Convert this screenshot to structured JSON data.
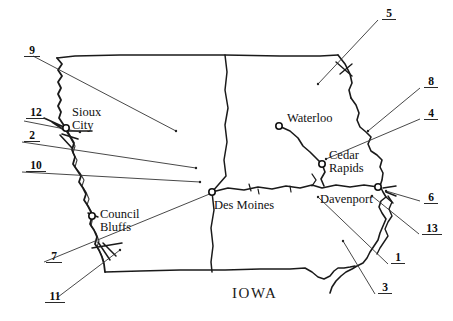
{
  "figure": {
    "type": "hand-drawn-map",
    "region_label": "IOWA",
    "background_color": "#ffffff",
    "ink_color": "#1a1a1a",
    "width": 453,
    "height": 321
  },
  "cities": [
    {
      "name": "Sioux City",
      "label_lines": [
        "Sioux",
        "City"
      ],
      "dot": {
        "x": 66,
        "y": 128
      },
      "label_pos": {
        "x": 72,
        "y": 106
      }
    },
    {
      "name": "Council Bluffs",
      "label_lines": [
        "Council",
        "Bluffs"
      ],
      "dot": {
        "x": 92,
        "y": 216
      },
      "label_pos": {
        "x": 100,
        "y": 208
      }
    },
    {
      "name": "Des Moines",
      "label_lines": [
        "Des Moines"
      ],
      "dot": {
        "x": 212,
        "y": 192
      },
      "label_pos": {
        "x": 214,
        "y": 199
      }
    },
    {
      "name": "Waterloo",
      "label_lines": [
        "Waterloo"
      ],
      "dot": {
        "x": 279,
        "y": 126
      },
      "label_pos": {
        "x": 287,
        "y": 112
      }
    },
    {
      "name": "Cedar Rapids",
      "label_lines": [
        "Cedar",
        "Rapids"
      ],
      "dot": {
        "x": 322,
        "y": 164
      },
      "label_pos": {
        "x": 329,
        "y": 149
      }
    },
    {
      "name": "Davenport",
      "label_lines": [
        "Davenport"
      ],
      "dot": {
        "x": 378,
        "y": 187
      },
      "label_pos": {
        "x": 320,
        "y": 193
      }
    }
  ],
  "callouts": [
    {
      "id": "9",
      "text": "9",
      "label_pos": {
        "x": 24,
        "y": 44
      },
      "underline_width": 16,
      "leader": {
        "x1": 33,
        "y1": 56,
        "x2": 176,
        "y2": 131
      }
    },
    {
      "id": "12",
      "text": "12",
      "label_pos": {
        "x": 26,
        "y": 106
      },
      "underline_width": 20,
      "leader": {
        "x1": 24,
        "y1": 121,
        "x2": 80,
        "y2": 132
      }
    },
    {
      "id": "2",
      "text": "2",
      "label_pos": {
        "x": 24,
        "y": 129
      },
      "underline_width": 16,
      "leader": {
        "x1": 22,
        "y1": 142,
        "x2": 196,
        "y2": 168
      }
    },
    {
      "id": "10",
      "text": "10",
      "label_pos": {
        "x": 26,
        "y": 159
      },
      "underline_width": 20,
      "leader": {
        "x1": 22,
        "y1": 172,
        "x2": 200,
        "y2": 182
      }
    },
    {
      "id": "7",
      "text": "7",
      "label_pos": {
        "x": 46,
        "y": 250
      },
      "underline_width": 16,
      "leader": {
        "x1": 44,
        "y1": 262,
        "x2": 212,
        "y2": 193
      }
    },
    {
      "id": "11",
      "text": "11",
      "label_pos": {
        "x": 45,
        "y": 290
      },
      "underline_width": 20,
      "leader": {
        "x1": 58,
        "y1": 297,
        "x2": 120,
        "y2": 250
      }
    },
    {
      "id": "5",
      "text": "5",
      "label_pos": {
        "x": 382,
        "y": 7
      },
      "underline_width": 14,
      "leader": {
        "x1": 378,
        "y1": 20,
        "x2": 318,
        "y2": 84
      }
    },
    {
      "id": "8",
      "text": "8",
      "label_pos": {
        "x": 424,
        "y": 75
      },
      "underline_width": 14,
      "leader": {
        "x1": 420,
        "y1": 88,
        "x2": 368,
        "y2": 131
      }
    },
    {
      "id": "4",
      "text": "4",
      "label_pos": {
        "x": 424,
        "y": 107
      },
      "underline_width": 14,
      "leader": {
        "x1": 420,
        "y1": 119,
        "x2": 326,
        "y2": 159
      }
    },
    {
      "id": "6",
      "text": "6",
      "label_pos": {
        "x": 424,
        "y": 191
      },
      "underline_width": 14,
      "leader": {
        "x1": 420,
        "y1": 201,
        "x2": 386,
        "y2": 191
      }
    },
    {
      "id": "13",
      "text": "13",
      "label_pos": {
        "x": 422,
        "y": 222
      },
      "underline_width": 20,
      "leader": {
        "x1": 419,
        "y1": 234,
        "x2": 372,
        "y2": 196
      }
    },
    {
      "id": "1",
      "text": "1",
      "label_pos": {
        "x": 391,
        "y": 251
      },
      "underline_width": 14,
      "leader": {
        "x1": 388,
        "y1": 264,
        "x2": 318,
        "y2": 197
      }
    },
    {
      "id": "3",
      "text": "3",
      "label_pos": {
        "x": 378,
        "y": 281
      },
      "underline_width": 14,
      "leader": {
        "x1": 375,
        "y1": 294,
        "x2": 343,
        "y2": 241
      }
    }
  ],
  "state_outline": {
    "north_border_y": 56,
    "south_border_y": 270,
    "west_x": 57,
    "east_x": 395
  },
  "interior_lines": [
    {
      "name": "central-river",
      "description": "vertical river line near x=225"
    }
  ]
}
